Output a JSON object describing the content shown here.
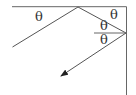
{
  "diagram": {
    "type": "reflection-corner-mirror",
    "labels": {
      "angle1": "θ",
      "angle2": "θ",
      "angle3": "θ",
      "angle4": "θ"
    },
    "colors": {
      "line": "#555555",
      "background": "#ffffff"
    }
  }
}
